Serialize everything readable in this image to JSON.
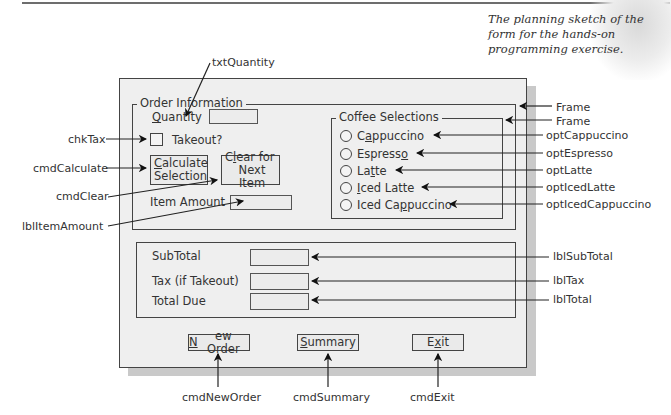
{
  "caption": "The planning sketch of the form for the hands-on programming exercise.",
  "form": {
    "order_frame": {
      "title": "Order Information"
    },
    "quantity": {
      "label_prefix": "",
      "label_accel": "Q",
      "label_rest": "uantity",
      "value": ""
    },
    "takeout": {
      "label": "Takeout?",
      "checked": false
    },
    "calculate_button": {
      "line1_accel": "C",
      "line1_rest": "alculate",
      "line2": "Selection"
    },
    "clear_button": {
      "line1_pre": "C",
      "line1_accel": "l",
      "line1_rest": "ear for",
      "line2": "Next Item"
    },
    "item_amount": {
      "label": "Item Amount",
      "value": ""
    },
    "coffee_frame": {
      "title": "Coffee Selections",
      "options": [
        {
          "pre": "C",
          "accel": "a",
          "post": "ppuccino",
          "selected": false
        },
        {
          "pre": "Espress",
          "accel": "o",
          "post": "",
          "selected": false
        },
        {
          "pre": "La",
          "accel": "t",
          "post": "te",
          "selected": false
        },
        {
          "pre": "",
          "accel": "I",
          "post": "ced Latte",
          "selected": false
        },
        {
          "pre": "Iced Ca",
          "accel": "p",
          "post": "puccino",
          "selected": false
        }
      ]
    },
    "totals": {
      "subtotal_label": "SubTotal",
      "tax_label": "Tax (if Takeout)",
      "total_label": "Total Due"
    },
    "buttons": {
      "new_order": {
        "accel": "N",
        "rest": "ew Order"
      },
      "summary": {
        "accel": "S",
        "rest": "ummary"
      },
      "exit": {
        "pre": "E",
        "accel": "x",
        "rest": "it"
      }
    }
  },
  "annotations": {
    "txtQuantity": "txtQuantity",
    "chkTax": "chkTax",
    "cmdCalculate": "cmdCalculate",
    "cmdClear": "cmdClear",
    "lblItemAmount": "lblItemAmount",
    "frame_outer": "Frame",
    "frame_inner": "Frame",
    "optCappuccino": "optCappuccino",
    "optEspresso": "optEspresso",
    "optLatte": "optLatte",
    "optIcedLatte": "optIcedLatte",
    "optIcedCappuccino": "optIcedCappuccino",
    "lblSubTotal": "lblSubTotal",
    "lblTax": "lblTax",
    "lblTotal": "lblTotal",
    "cmdNewOrder": "cmdNewOrder",
    "cmdSummary": "cmdSummary",
    "cmdExit": "cmdExit"
  }
}
